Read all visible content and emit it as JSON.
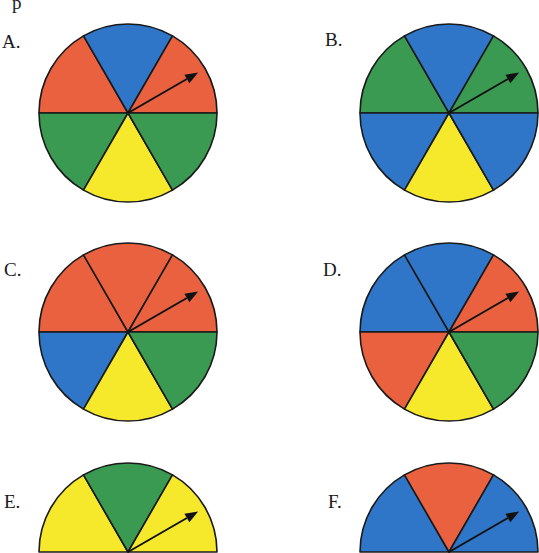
{
  "header_fragment": "p",
  "colors": {
    "red": "#ea6140",
    "blue": "#2f76c8",
    "green": "#3a9a52",
    "yellow": "#f6e92c",
    "outline": "#1a1a1a"
  },
  "spinners": [
    {
      "label": "A.",
      "shape": "circle",
      "cx": 128,
      "cy": 113,
      "r": 89,
      "label_x": 2,
      "label_y": 32,
      "sectors": [
        "red",
        "blue",
        "red",
        "green",
        "yellow",
        "green"
      ]
    },
    {
      "label": "B.",
      "shape": "circle",
      "cx": 449,
      "cy": 113,
      "r": 89,
      "label_x": 325,
      "label_y": 30,
      "sectors": [
        "green",
        "blue",
        "green",
        "blue",
        "yellow",
        "blue"
      ]
    },
    {
      "label": "C.",
      "shape": "circle",
      "cx": 128,
      "cy": 332,
      "r": 89,
      "label_x": 4,
      "label_y": 260,
      "sectors": [
        "red",
        "red",
        "red",
        "blue",
        "yellow",
        "green"
      ]
    },
    {
      "label": "D.",
      "shape": "circle",
      "cx": 449,
      "cy": 332,
      "r": 89,
      "label_x": 323,
      "label_y": 260,
      "sectors": [
        "blue",
        "blue",
        "red",
        "red",
        "yellow",
        "green"
      ]
    },
    {
      "label": "E.",
      "shape": "semicircle",
      "cx": 128,
      "cy": 552,
      "r": 89,
      "label_x": 4,
      "label_y": 492,
      "sectors": [
        "yellow",
        "green",
        "yellow"
      ]
    },
    {
      "label": "F.",
      "shape": "semicircle",
      "cx": 449,
      "cy": 552,
      "r": 89,
      "label_x": 328,
      "label_y": 492,
      "sectors": [
        "blue",
        "red",
        "blue"
      ]
    }
  ],
  "sector_order_note": "upper-left, top, upper-right, lower-left, bottom, lower-right",
  "arrow": {
    "angle_deg": 30,
    "length": 81
  }
}
